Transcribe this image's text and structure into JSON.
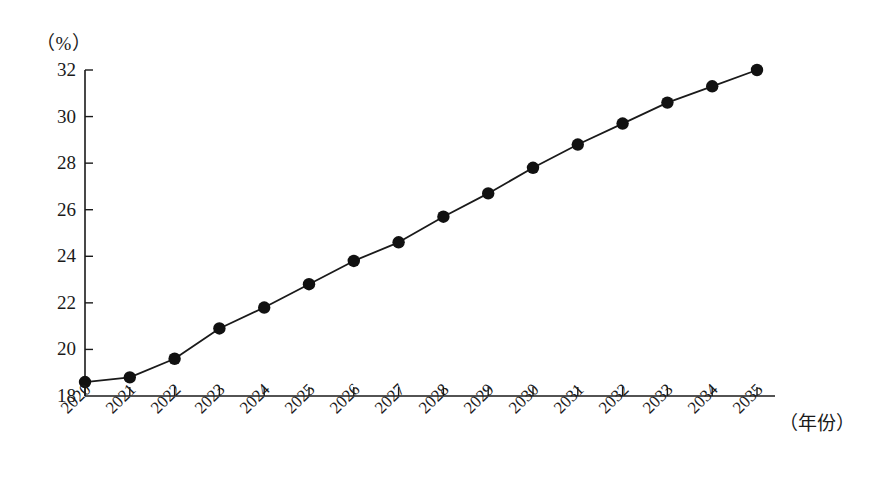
{
  "chart_data": {
    "type": "line",
    "title": "",
    "subtitle": "",
    "xlabel": "（年份）",
    "ylabel": "（%）",
    "categories": [
      "2020",
      "2021",
      "2022",
      "2023",
      "2024",
      "2025",
      "2026",
      "2027",
      "2028",
      "2029",
      "2030",
      "2031",
      "2032",
      "2033",
      "2034",
      "2035"
    ],
    "values": [
      18.6,
      18.8,
      19.6,
      20.9,
      21.8,
      22.8,
      23.8,
      24.6,
      25.7,
      26.7,
      27.8,
      28.8,
      29.7,
      30.6,
      31.3,
      32.0
    ],
    "series": [
      {
        "name": "",
        "values": [
          18.6,
          18.8,
          19.6,
          20.9,
          21.8,
          22.8,
          23.8,
          24.6,
          25.7,
          26.7,
          27.8,
          28.8,
          29.7,
          30.6,
          31.3,
          32.0
        ]
      }
    ],
    "ylim": [
      18,
      32
    ],
    "yticks": [
      18,
      20,
      22,
      24,
      26,
      28,
      30,
      32
    ],
    "ytick_labels": [
      "18",
      "20",
      "22",
      "24",
      "26",
      "28",
      "30",
      "32"
    ],
    "xtick_labels": [
      "2020",
      "2021",
      "2022",
      "2023",
      "2024",
      "2025",
      "2026",
      "2027",
      "2028",
      "2029",
      "2030",
      "2031",
      "2032",
      "2033",
      "2034",
      "2035"
    ],
    "grid": false,
    "legend": false,
    "legend_position": "none",
    "marker": "filled-circle",
    "line_color": "#1a1a1a",
    "marker_color": "#111111",
    "axis_color": "#1a1a1a",
    "background_color": "#ffffff"
  }
}
